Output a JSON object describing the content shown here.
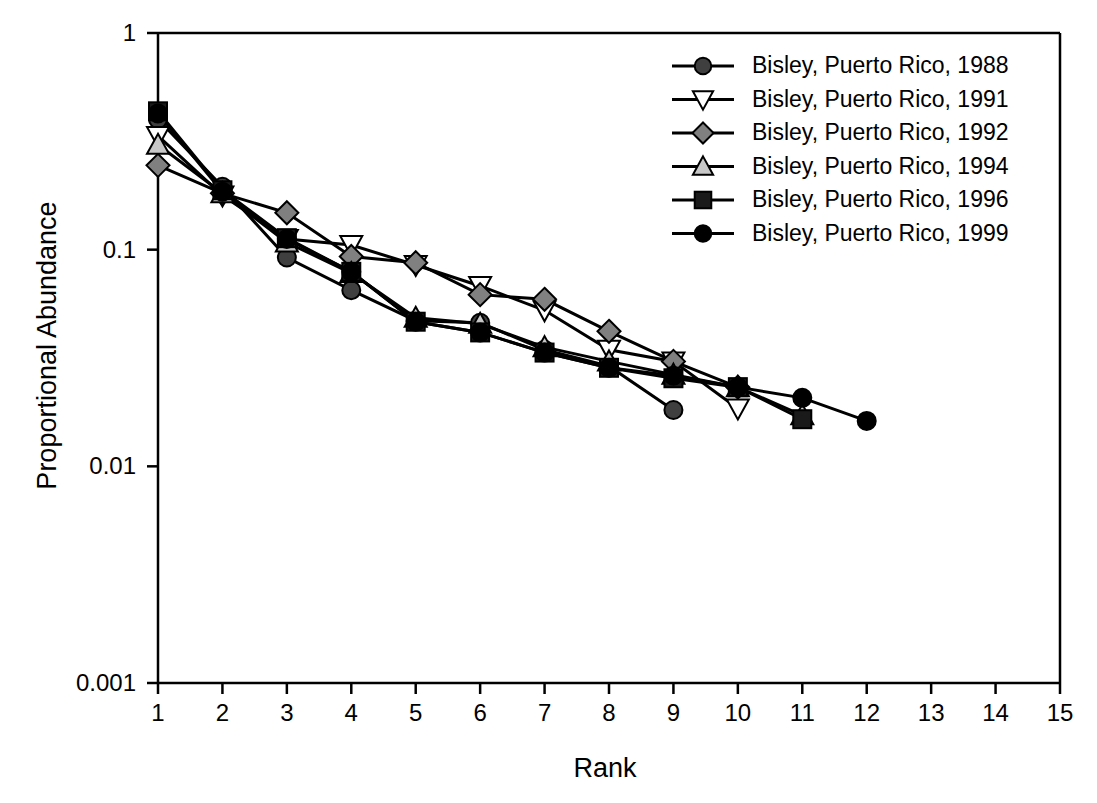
{
  "chart_data": {
    "type": "line",
    "title": "",
    "xlabel": "Rank",
    "ylabel": "Proportional Abundance",
    "yscale": "log",
    "xscale": "linear",
    "xlim": [
      1,
      15
    ],
    "ylim": [
      0.001,
      1
    ],
    "grid": false,
    "legend_position": "top-right",
    "x_tick_labels": [
      "1",
      "2",
      "3",
      "4",
      "5",
      "6",
      "7",
      "8",
      "9",
      "10",
      "11",
      "12",
      "13",
      "14",
      "15"
    ],
    "x_tick_values": [
      1,
      2,
      3,
      4,
      5,
      6,
      7,
      8,
      9,
      10,
      11,
      12,
      13,
      14,
      15
    ],
    "y_tick_labels": [
      "1",
      "0.1",
      "0.01",
      "0.001"
    ],
    "y_tick_values": [
      1,
      0.1,
      0.01,
      0.001
    ],
    "series": [
      {
        "name": "Bisley, Puerto Rico, 1988",
        "marker": "circle",
        "marker_fill": "#3f3f3f",
        "marker_stroke": "#000000",
        "line_color": "#000000",
        "x": [
          1,
          2,
          3,
          4,
          5,
          6,
          7,
          8,
          9
        ],
        "values": [
          0.4,
          0.195,
          0.092,
          0.065,
          0.047,
          0.046,
          0.0345,
          0.029,
          0.0182
        ]
      },
      {
        "name": "Bisley, Puerto Rico, 1991",
        "marker": "triangle-down",
        "marker_fill": "#ffffff",
        "marker_stroke": "#000000",
        "line_color": "#000000",
        "x": [
          1,
          2,
          3,
          4,
          5,
          6,
          7,
          8,
          9,
          10
        ],
        "values": [
          0.335,
          0.178,
          0.112,
          0.105,
          0.085,
          0.068,
          0.0525,
          0.0345,
          0.0305,
          0.0185
        ]
      },
      {
        "name": "Bisley, Puerto Rico, 1992",
        "marker": "diamond",
        "marker_fill": "#808080",
        "marker_stroke": "#000000",
        "line_color": "#000000",
        "x": [
          1,
          2,
          3,
          4,
          5,
          6,
          7,
          8,
          9,
          10
        ],
        "values": [
          0.245,
          0.182,
          0.148,
          0.093,
          0.087,
          0.062,
          0.059,
          0.042,
          0.0305,
          0.0232
        ]
      },
      {
        "name": "Bisley, Puerto Rico, 1994",
        "marker": "triangle-up",
        "marker_fill": "#c8c8c8",
        "marker_stroke": "#000000",
        "line_color": "#000000",
        "x": [
          1,
          2,
          3,
          4,
          5,
          6,
          7,
          8,
          9,
          10,
          11
        ],
        "values": [
          0.305,
          0.182,
          0.108,
          0.078,
          0.0485,
          0.0455,
          0.0355,
          0.0305,
          0.0265,
          0.0232,
          0.0172
        ]
      },
      {
        "name": "Bisley, Puerto Rico, 1996",
        "marker": "square",
        "marker_fill": "#1a1a1a",
        "marker_stroke": "#000000",
        "line_color": "#000000",
        "x": [
          1,
          2,
          3,
          4,
          5,
          6,
          7,
          8,
          9,
          10,
          11
        ],
        "values": [
          0.435,
          0.188,
          0.113,
          0.079,
          0.0465,
          0.0415,
          0.0335,
          0.0285,
          0.0255,
          0.0232,
          0.0165
        ]
      },
      {
        "name": "Bisley, Puerto Rico, 1999",
        "marker": "circle",
        "marker_fill": "#000000",
        "marker_stroke": "#000000",
        "line_color": "#000000",
        "x": [
          1,
          2,
          3,
          4,
          5,
          6,
          7,
          8,
          9,
          10,
          11,
          12
        ],
        "values": [
          0.425,
          0.185,
          0.112,
          0.079,
          0.0465,
          0.0415,
          0.0335,
          0.0285,
          0.0262,
          0.0232,
          0.0207,
          0.0162
        ]
      }
    ]
  },
  "legend": {
    "entries": [
      {
        "label": "Bisley, Puerto Rico, 1988"
      },
      {
        "label": "Bisley, Puerto Rico, 1991"
      },
      {
        "label": "Bisley, Puerto Rico, 1992"
      },
      {
        "label": "Bisley, Puerto Rico, 1994"
      },
      {
        "label": "Bisley, Puerto Rico, 1996"
      },
      {
        "label": "Bisley, Puerto Rico, 1999"
      }
    ]
  },
  "axes": {
    "x_title": "Rank",
    "y_title": "Proportional Abundance"
  }
}
